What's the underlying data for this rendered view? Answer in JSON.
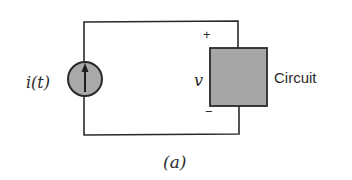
{
  "diagram": {
    "type": "circuit-schematic",
    "source": {
      "kind": "current-source",
      "label": "i(t)",
      "arrow_direction": "up",
      "fill": "#a9a9a9"
    },
    "load": {
      "label": "Circuit",
      "fill": "#a6a6a6",
      "voltage_label": "v",
      "plus_label": "+",
      "minus_label": "−"
    },
    "caption": "(a)",
    "colors": {
      "wire": "#2a2a2a",
      "text": "#2b2b2b",
      "background": "#ffffff"
    }
  }
}
